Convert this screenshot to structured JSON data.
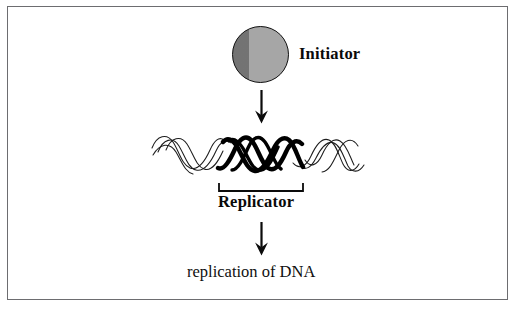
{
  "figure": {
    "background_color": "#ffffff",
    "frame_color": "#6d6d70"
  },
  "nodes": {
    "initiator": {
      "label": "Initiator",
      "shape": "filled-circle",
      "fill_color": "#6d6d6d",
      "outline_color": "#121212"
    },
    "replicator": {
      "label": "Replicator",
      "bracket": "upward-bracket"
    },
    "outcome": {
      "label": "replication of DNA"
    }
  },
  "icons": {
    "arrow_top": "down-arrow-icon",
    "arrow_bottom": "down-arrow-icon",
    "dna": "dna-double-helix-icon",
    "bracket": "span-bracket-icon"
  },
  "dna": {
    "description": "DNA double helix, central region drawn in bold to mark the replicator",
    "strand_count": 2,
    "highlighted_region": "Replicator"
  }
}
